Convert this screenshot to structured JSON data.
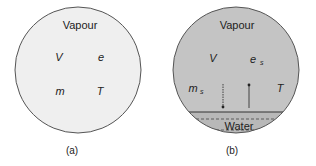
{
  "panel_a": {
    "title": "Vapour",
    "labels": {
      "V": "V",
      "e": "e",
      "m": "m",
      "T": "T"
    },
    "caption": "(a)",
    "fill": "#efefef"
  },
  "panel_b": {
    "title": "Vapour",
    "labels": {
      "V": "V",
      "e": "e",
      "e_sub": "s",
      "m": "m",
      "m_sub": "s",
      "T": "T"
    },
    "water_label": "Water",
    "caption": "(b)",
    "fill": "#c4c4c4"
  }
}
